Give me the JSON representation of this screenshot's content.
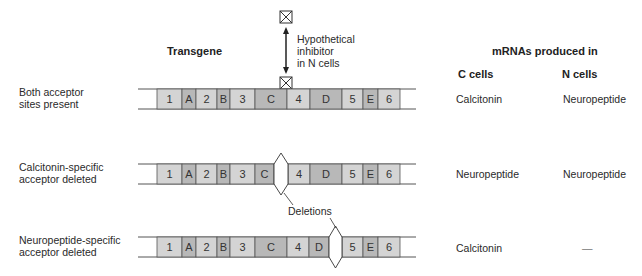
{
  "header": {
    "transgene": "Transgene",
    "mrnas": "mRNAs produced in",
    "c_cells": "C cells",
    "n_cells": "N cells"
  },
  "inhibitor": {
    "label_lines": [
      "Hypothetical",
      "inhibitor",
      "in N cells"
    ]
  },
  "deletions_label": "Deletions",
  "colors": {
    "exon_light": "#d4d4d4",
    "exon_dark": "#b8b8b8",
    "line": "#555555",
    "text": "#2a2a2a"
  },
  "rows": [
    {
      "label_lines": [
        "Both acceptor",
        "sites present"
      ],
      "c_cells": "Calcitonin",
      "n_cells": "Neuropeptide",
      "y": 89,
      "segments": [
        {
          "label": "1",
          "x0": 157,
          "x1": 182,
          "shade": "light"
        },
        {
          "label": "A",
          "x0": 182,
          "x1": 196,
          "shade": "dark"
        },
        {
          "label": "2",
          "x0": 196,
          "x1": 217,
          "shade": "light"
        },
        {
          "label": "B",
          "x0": 217,
          "x1": 230,
          "shade": "dark"
        },
        {
          "label": "3",
          "x0": 230,
          "x1": 255,
          "shade": "light"
        },
        {
          "label": "C",
          "x0": 255,
          "x1": 287,
          "shade": "dark"
        },
        {
          "label": "4",
          "x0": 287,
          "x1": 310,
          "shade": "light"
        },
        {
          "label": "D",
          "x0": 310,
          "x1": 342,
          "shade": "dark"
        },
        {
          "label": "5",
          "x0": 342,
          "x1": 363,
          "shade": "light"
        },
        {
          "label": "E",
          "x0": 363,
          "x1": 378,
          "shade": "dark"
        },
        {
          "label": "6",
          "x0": 378,
          "x1": 400,
          "shade": "light"
        }
      ],
      "deletion": null
    },
    {
      "label_lines": [
        "Calcitonin-specific",
        "acceptor deleted"
      ],
      "c_cells": "Neuropeptide",
      "n_cells": "Neuropeptide",
      "y": 164,
      "segments": [
        {
          "label": "1",
          "x0": 157,
          "x1": 182,
          "shade": "light"
        },
        {
          "label": "A",
          "x0": 182,
          "x1": 196,
          "shade": "dark"
        },
        {
          "label": "2",
          "x0": 196,
          "x1": 217,
          "shade": "light"
        },
        {
          "label": "B",
          "x0": 217,
          "x1": 230,
          "shade": "dark"
        },
        {
          "label": "3",
          "x0": 230,
          "x1": 255,
          "shade": "light"
        },
        {
          "label": "C",
          "x0": 255,
          "x1": 274,
          "shade": "dark"
        },
        {
          "label": "4",
          "x0": 288,
          "x1": 310,
          "shade": "light"
        },
        {
          "label": "D",
          "x0": 310,
          "x1": 342,
          "shade": "dark"
        },
        {
          "label": "5",
          "x0": 342,
          "x1": 363,
          "shade": "light"
        },
        {
          "label": "E",
          "x0": 363,
          "x1": 378,
          "shade": "dark"
        },
        {
          "label": "6",
          "x0": 378,
          "x1": 400,
          "shade": "light"
        }
      ],
      "deletion": {
        "x0": 274,
        "x1": 288
      }
    },
    {
      "label_lines": [
        "Neuropeptide-specific",
        "acceptor deleted"
      ],
      "c_cells": "Calcitonin",
      "n_cells": "—",
      "y": 237,
      "segments": [
        {
          "label": "1",
          "x0": 157,
          "x1": 182,
          "shade": "light"
        },
        {
          "label": "A",
          "x0": 182,
          "x1": 196,
          "shade": "dark"
        },
        {
          "label": "2",
          "x0": 196,
          "x1": 217,
          "shade": "light"
        },
        {
          "label": "B",
          "x0": 217,
          "x1": 230,
          "shade": "dark"
        },
        {
          "label": "3",
          "x0": 230,
          "x1": 255,
          "shade": "light"
        },
        {
          "label": "C",
          "x0": 255,
          "x1": 287,
          "shade": "dark"
        },
        {
          "label": "4",
          "x0": 287,
          "x1": 309,
          "shade": "light"
        },
        {
          "label": "D",
          "x0": 309,
          "x1": 329,
          "shade": "dark"
        },
        {
          "label": "5",
          "x0": 342,
          "x1": 363,
          "shade": "light"
        },
        {
          "label": "E",
          "x0": 363,
          "x1": 378,
          "shade": "dark"
        },
        {
          "label": "6",
          "x0": 378,
          "x1": 400,
          "shade": "light"
        }
      ],
      "deletion": {
        "x0": 329,
        "x1": 342
      }
    }
  ]
}
